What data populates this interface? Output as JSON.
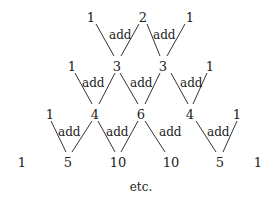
{
  "rows": [
    [
      "1",
      "2",
      "1"
    ],
    [
      "1",
      "3",
      "3",
      "1"
    ],
    [
      "1",
      "4",
      "6",
      "4",
      "1"
    ],
    [
      "1",
      "5",
      "10",
      "10",
      "5",
      "1"
    ]
  ],
  "operation_label": "add",
  "footer": "etc."
}
